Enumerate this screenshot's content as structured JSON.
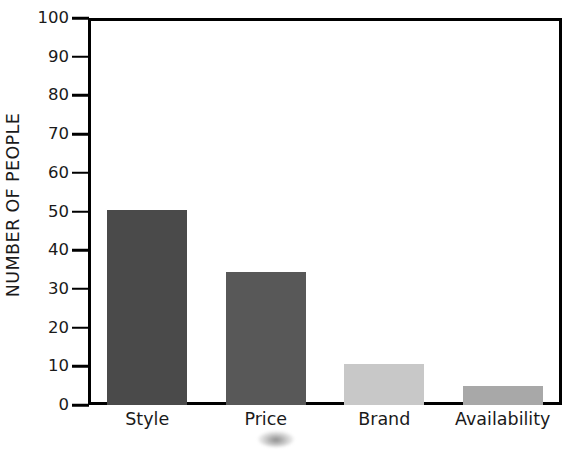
{
  "chart_data": {
    "type": "bar",
    "title": "",
    "xlabel": "",
    "ylabel": "NUMBER OF PEOPLE",
    "categories": [
      "Style",
      "Price",
      "Brand",
      "Availability"
    ],
    "values": [
      50.5,
      34.5,
      10.5,
      5
    ],
    "bar_colors": [
      "#4a4a4a",
      "#585858",
      "#c8c8c8",
      "#a8a8a8"
    ],
    "ylim": [
      0,
      100
    ],
    "yticks": [
      0,
      10,
      20,
      30,
      40,
      50,
      60,
      70,
      80,
      90,
      100
    ],
    "ytick_labels": [
      "0",
      "10",
      "20",
      "30",
      "40",
      "50",
      "60",
      "70",
      "80",
      "90",
      "100"
    ],
    "grid": false,
    "legend": null,
    "frame_color": "#000000",
    "background_color": "#ffffff"
  },
  "axes": {
    "y_title": "NUMBER OF PEOPLE"
  },
  "artifacts": {
    "smudge_label": "scan-smudge"
  }
}
